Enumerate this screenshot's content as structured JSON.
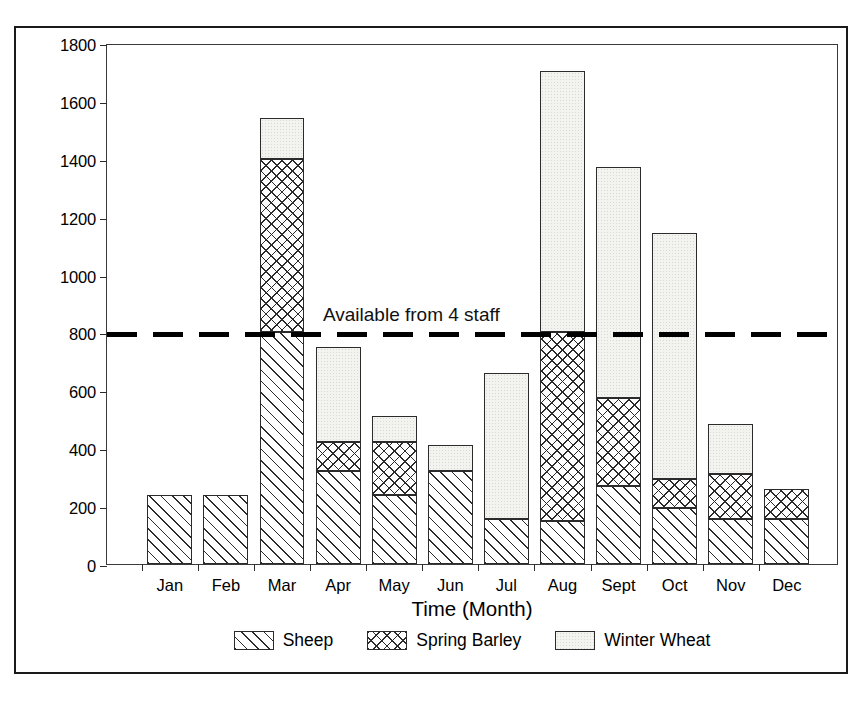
{
  "chart_data": {
    "type": "bar",
    "subtype": "stacked-bar",
    "title": "",
    "xlabel": "Time (Month)",
    "ylabel": "Labour Requirement [Man Hours]",
    "categories": [
      "Jan",
      "Feb",
      "Mar",
      "Apr",
      "May",
      "Jun",
      "Jul",
      "Aug",
      "Sept",
      "Oct",
      "Nov",
      "Dec"
    ],
    "ylim": [
      0,
      1800
    ],
    "yticks": [
      0,
      200,
      400,
      600,
      800,
      1000,
      1200,
      1400,
      1600,
      1800
    ],
    "ytick_labels": [
      "0",
      "200",
      "400",
      "600",
      "800",
      "1000",
      "1200",
      "1400",
      "1600",
      "1800"
    ],
    "grid": false,
    "legend_position": "below-axis-center",
    "series": [
      {
        "name": "Sheep",
        "pattern": "diagonal-hatch",
        "values": [
          240,
          240,
          800,
          320,
          240,
          320,
          155,
          150,
          270,
          195,
          155,
          155
        ]
      },
      {
        "name": "Spring Barley",
        "pattern": "cross-hatch",
        "values": [
          0,
          0,
          600,
          100,
          180,
          0,
          0,
          650,
          305,
          100,
          155,
          105
        ]
      },
      {
        "name": "Winter Wheat",
        "pattern": "light-stipple",
        "values": [
          0,
          0,
          140,
          330,
          90,
          90,
          505,
          905,
          795,
          850,
          175,
          0
        ]
      }
    ],
    "cumulative_totals": [
      240,
      240,
      1540,
      750,
      510,
      410,
      660,
      1705,
      1370,
      1145,
      485,
      260
    ],
    "annotations": [
      {
        "name": "available-from-4-staff",
        "type": "horizontal-threshold-line",
        "label": "Available from 4 staff",
        "value": 800,
        "style": "thick-dashed",
        "color": "#000000"
      }
    ]
  },
  "legend": {
    "items": [
      {
        "label": "Sheep",
        "pattern": "diagonal-hatch"
      },
      {
        "label": "Spring Barley",
        "pattern": "cross-hatch"
      },
      {
        "label": "Winter Wheat",
        "pattern": "light-stipple"
      }
    ]
  },
  "colors": {
    "ink": "#000000",
    "axis": "#2a2a2a",
    "wheat_fill": "#f3f3f0",
    "background": "#ffffff"
  }
}
